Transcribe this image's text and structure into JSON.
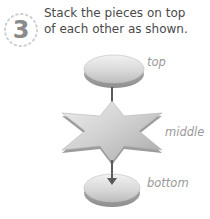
{
  "step": {
    "number": "3",
    "instruction_lines": [
      "Stack the pieces on top",
      "of each other as shown."
    ]
  },
  "diagram": {
    "pieces": [
      {
        "id": "top",
        "shape": "disc",
        "label": "top"
      },
      {
        "id": "middle",
        "shape": "six-point-star",
        "label": "middle"
      },
      {
        "id": "bottom",
        "shape": "disc",
        "label": "bottom"
      }
    ],
    "arrows": [
      {
        "from": "top",
        "to": "middle"
      },
      {
        "from": "middle",
        "to": "bottom"
      }
    ],
    "colors": {
      "piece_fill": "#c9c9c9",
      "piece_shadow": "#9e9e9e",
      "arrow": "#5a5a5a",
      "label": "#9a9a9a",
      "step_number": "#8a8a8a"
    }
  }
}
